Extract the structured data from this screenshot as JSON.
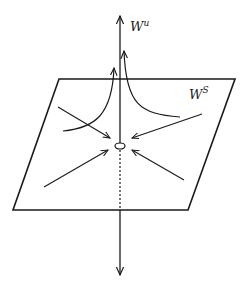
{
  "diagram": {
    "type": "stable-unstable-manifold",
    "labels": {
      "unstable_base": "W",
      "unstable_sup": "u",
      "stable_base": "W",
      "stable_sup": "S"
    },
    "colors": {
      "stroke": "#1a1a1a",
      "background": "#ffffff"
    }
  }
}
